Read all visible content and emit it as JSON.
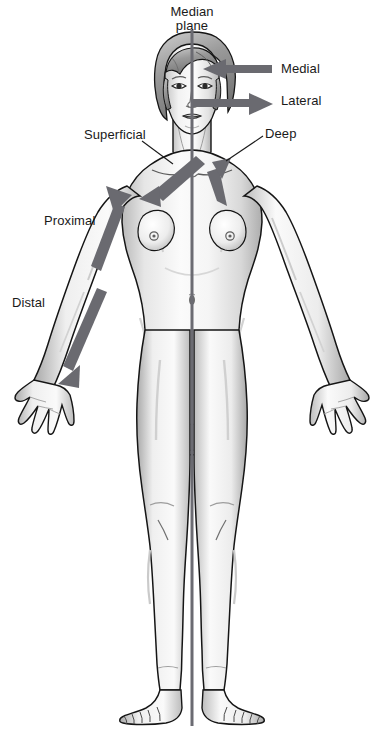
{
  "figure": {
    "background_color": "#ffffff",
    "width": 382,
    "height": 730
  },
  "median_plane": {
    "label_line1": "Median",
    "label_line2": "plane",
    "color": "#6b6b72",
    "x": 192,
    "y_top": 30,
    "y_bottom": 726,
    "thickness": 3
  },
  "labels": {
    "medial": "Medial",
    "lateral": "Lateral",
    "deep": "Deep",
    "superficial": "Superficial",
    "proximal": "Proximal",
    "distal": "Distal"
  },
  "arrows": {
    "color": "#6a6a70",
    "medial": {
      "name": "Medial",
      "direction": "left",
      "description": "Horizontal arrow pointing left toward the median plane at forehead level"
    },
    "lateral": {
      "name": "Lateral",
      "direction": "right",
      "description": "Horizontal arrow pointing right away from the median plane at nose level"
    },
    "deep": {
      "name": "Deep",
      "direction": "up-left",
      "description": "Arrow from right shoulder pointing up-left toward the sternum"
    },
    "superficial": {
      "name": "Superficial",
      "direction": "down-left",
      "description": "Arrow from left clavicle pointing down-left toward the chest surface"
    },
    "limb": {
      "name": "Proximal-Distal",
      "direction": "double",
      "description": "Double-headed arrow along the right arm: up toward shoulder is proximal, down toward hand is distal"
    }
  },
  "colors": {
    "outline": "#151515",
    "skin_light": "#fbfbfb",
    "shade_light": "#e3e3e3",
    "shade_mid": "#c9c9c9",
    "shade_dark": "#9a9a9a",
    "hair": "#8d8d8d",
    "text": "#1a1a1a",
    "arrow": "#6a6a70",
    "plane": "#6b6b72"
  }
}
